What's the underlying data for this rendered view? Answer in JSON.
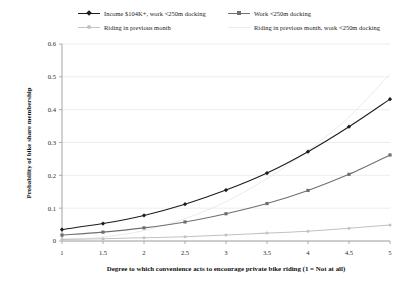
{
  "chart_data": {
    "type": "line",
    "title": "",
    "xlabel": "Degree to which convenience acts to encourage private bike riding (1 = Not at all)",
    "ylabel": "Probability of bike share membership",
    "xlim": [
      1,
      5
    ],
    "ylim": [
      0,
      0.6
    ],
    "x": [
      1,
      1.5,
      2,
      2.5,
      3,
      3.5,
      4,
      4.5,
      5
    ],
    "xticks": [
      "1",
      "1.5",
      "2",
      "2.5",
      "3",
      "3.5",
      "4",
      "4.5",
      "5"
    ],
    "yticks": [
      "0",
      "0.1",
      "0.2",
      "0.3",
      "0.4",
      "0.5",
      "0.6"
    ],
    "grid": true,
    "legend_position": "top",
    "series": [
      {
        "name": "Income $104K+, work <250m docking",
        "color": "#1c1c1c",
        "marker": "diamond",
        "values": [
          0.035,
          0.053,
          0.078,
          0.112,
          0.155,
          0.207,
          0.272,
          0.348,
          0.432
        ]
      },
      {
        "name": "Work <250m docking",
        "color": "#6f6f6f",
        "marker": "square",
        "values": [
          0.018,
          0.027,
          0.04,
          0.058,
          0.083,
          0.114,
          0.154,
          0.203,
          0.262
        ]
      },
      {
        "name": "Riding in previous month",
        "color": "#c2c2c2",
        "marker": "circle",
        "values": [
          0.005,
          0.007,
          0.01,
          0.013,
          0.018,
          0.024,
          0.03,
          0.039,
          0.049
        ]
      },
      {
        "name": "Riding in previous month, work <250m docking",
        "color": "#ebebeb",
        "marker": "none",
        "values": [
          0.004,
          0.012,
          0.032,
          0.068,
          0.12,
          0.19,
          0.275,
          0.378,
          0.508
        ]
      }
    ]
  },
  "legend": {
    "items": [
      {
        "label": "Income $104K+, work <250m docking"
      },
      {
        "label": "Work <250m docking"
      },
      {
        "label": "Riding in previous month"
      },
      {
        "label": "Riding in previous month, work <250m docking"
      }
    ]
  }
}
